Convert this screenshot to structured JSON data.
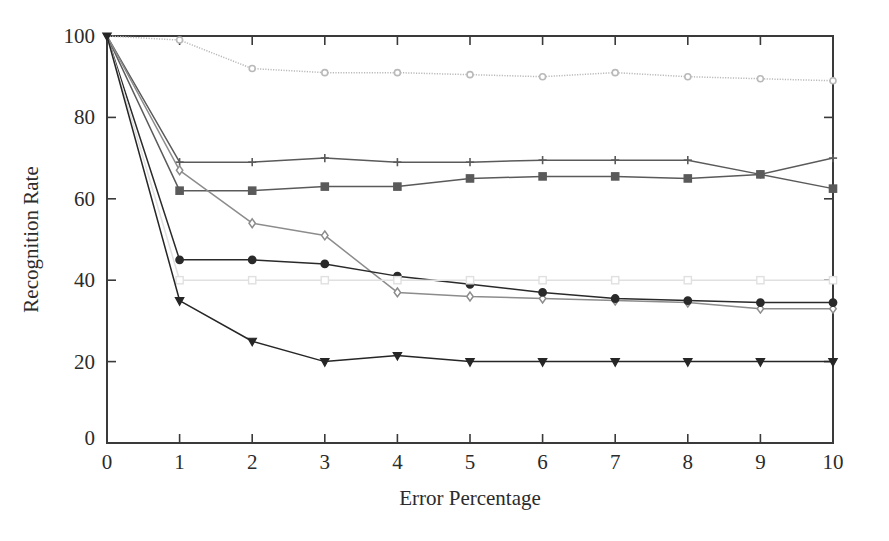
{
  "chart_data": {
    "type": "line",
    "title": "",
    "subtitle": "",
    "xlabel": "Error Percentage",
    "ylabel": "Recognition Rate",
    "x": [
      0,
      1,
      2,
      3,
      4,
      5,
      6,
      7,
      8,
      9,
      10
    ],
    "xlim": [
      0,
      10
    ],
    "ylim": [
      0,
      100
    ],
    "xticks": [
      "0",
      "1",
      "2",
      "3",
      "4",
      "5",
      "6",
      "7",
      "8",
      "9",
      "10"
    ],
    "yticks": [
      "0",
      "20",
      "40",
      "60",
      "80",
      "100"
    ],
    "grid": false,
    "legend": "none",
    "series": [
      {
        "name": "series-1",
        "marker": "circle",
        "color": "#b9b9b9",
        "line_style": "dotted",
        "values": [
          100,
          99,
          92,
          91,
          91,
          90.5,
          90,
          91,
          90,
          89.5,
          89
        ]
      },
      {
        "name": "series-2",
        "marker": "plus",
        "color": "#5a5a5a",
        "line_style": "solid",
        "values": [
          100,
          69,
          69,
          70,
          69,
          69,
          69.5,
          69.5,
          69.5,
          66,
          70
        ]
      },
      {
        "name": "series-3",
        "marker": "square",
        "color": "#5a5a5a",
        "line_style": "solid",
        "values": [
          100,
          62,
          62,
          63,
          63,
          65,
          65.5,
          65.5,
          65,
          66,
          62.5
        ]
      },
      {
        "name": "series-4",
        "marker": "diamond",
        "color": "#8c8c8c",
        "line_style": "solid",
        "values": [
          100,
          67,
          54,
          51,
          37,
          36,
          35.5,
          35,
          34.5,
          33,
          33
        ]
      },
      {
        "name": "series-5",
        "marker": "circle-filled",
        "color": "#2a2a2a",
        "line_style": "solid",
        "values": [
          100,
          45,
          45,
          44,
          41,
          39,
          37,
          35.5,
          35,
          34.5,
          34.5
        ]
      },
      {
        "name": "series-6",
        "marker": "square-open",
        "color": "#e0e0e0",
        "line_style": "solid",
        "values": [
          100,
          40,
          40,
          40,
          40,
          40,
          40,
          40,
          40,
          40,
          40
        ]
      },
      {
        "name": "series-7",
        "marker": "triangle-down",
        "color": "#262626",
        "line_style": "solid",
        "values": [
          100,
          35,
          25,
          20,
          21.5,
          20,
          20,
          20,
          20,
          20,
          20
        ]
      }
    ]
  },
  "axes": {
    "x_label": "Error Percentage",
    "y_label": "Recognition Rate"
  },
  "colors": {
    "axis": "#3a3a3a",
    "text": "#2b2b2b",
    "background": "#ffffff"
  }
}
